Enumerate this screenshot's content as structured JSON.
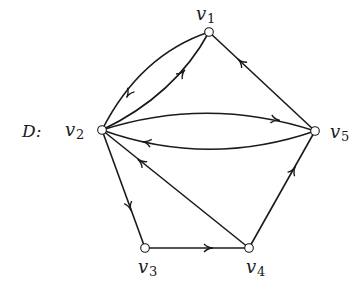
{
  "graph": {
    "name": "D",
    "name_label": "D:",
    "directed": true,
    "colors": {
      "stroke": "#1a1a1a",
      "node_fill": "#ffffff",
      "background": "#ffffff"
    },
    "nodes": [
      {
        "id": "v1",
        "label": "v",
        "sub": "1",
        "x": 209,
        "y": 32,
        "lx": 196,
        "ly": 20,
        "sx": 207,
        "sy": 23
      },
      {
        "id": "v2",
        "label": "v",
        "sub": "2",
        "x": 102,
        "y": 130,
        "lx": 65,
        "ly": 136,
        "sx": 76,
        "sy": 139
      },
      {
        "id": "v3",
        "label": "v",
        "sub": "3",
        "x": 145,
        "y": 248,
        "lx": 138,
        "ly": 273,
        "sx": 149,
        "sy": 276
      },
      {
        "id": "v4",
        "label": "v",
        "sub": "4",
        "x": 249,
        "y": 248,
        "lx": 246,
        "ly": 273,
        "sx": 257,
        "sy": 276
      },
      {
        "id": "v5",
        "label": "v",
        "sub": "5",
        "x": 315,
        "y": 131,
        "lx": 330,
        "ly": 138,
        "sx": 341,
        "sy": 141
      }
    ],
    "edges": [
      {
        "id": "e1",
        "from": "v1",
        "to": "v2",
        "path": "M209,32 Q140,55 102,130",
        "arrow": {
          "x": 128,
          "y": 95,
          "angle": 120
        }
      },
      {
        "id": "e2",
        "from": "v2",
        "to": "v1",
        "path": "M102,130 Q175,95 209,32",
        "arrow": {
          "x": 183,
          "y": 72,
          "angle": -50
        }
      },
      {
        "id": "e3",
        "from": "v5",
        "to": "v1",
        "path": "M315,131 L209,32",
        "arrow": {
          "x": 240,
          "y": 61,
          "angle": -137
        }
      },
      {
        "id": "e4",
        "from": "v2",
        "to": "v5",
        "path": "M102,130 Q208,96 315,131",
        "arrow": {
          "x": 277,
          "y": 120,
          "angle": 10
        }
      },
      {
        "id": "e5",
        "from": "v5",
        "to": "v2",
        "path": "M315,131 Q208,168 102,130",
        "arrow": {
          "x": 145,
          "y": 142,
          "angle": 192
        }
      },
      {
        "id": "e6",
        "from": "v4",
        "to": "v2",
        "path": "M249,248 L102,130",
        "arrow": {
          "x": 140,
          "y": 161,
          "angle": -141
        }
      },
      {
        "id": "e7",
        "from": "v2",
        "to": "v3",
        "path": "M102,130 L145,248",
        "arrow": {
          "x": 130,
          "y": 208,
          "angle": 70
        }
      },
      {
        "id": "e8",
        "from": "v3",
        "to": "v4",
        "path": "M145,248 L249,248",
        "arrow": {
          "x": 210,
          "y": 248,
          "angle": 0
        }
      },
      {
        "id": "e9",
        "from": "v4",
        "to": "v5",
        "path": "M249,248 L315,131",
        "arrow": {
          "x": 294,
          "y": 169,
          "angle": -61
        }
      }
    ]
  }
}
